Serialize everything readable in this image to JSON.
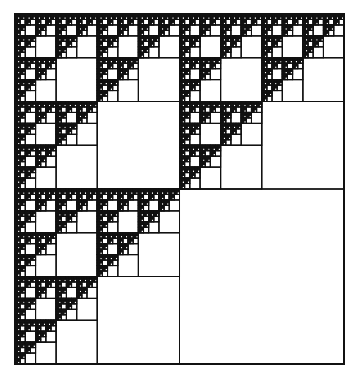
{
  "figure": {
    "type": "sierpinski-square-fractal",
    "box": {
      "x": 15,
      "y": 14,
      "width": 329,
      "height": 350
    },
    "depth": 7,
    "empty_quadrant": "bottom-right",
    "line_color": "#111111",
    "fill_color": "#ffffff",
    "outer_stroke_width": 2,
    "inner_stroke_width": 1
  }
}
